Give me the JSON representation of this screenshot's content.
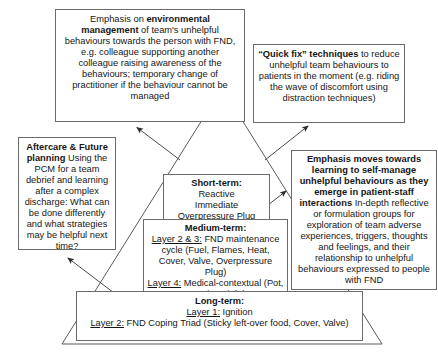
{
  "diagram": {
    "colors": {
      "box_border": "#6b6b6b",
      "triangle_stroke": "#5a5a5a",
      "arrow_stroke": "#4a4a4a",
      "background": "#ffffff",
      "text": "#161616"
    },
    "boxes": {
      "environmental_management": {
        "name": "environmental-management-box",
        "lead_bold": "environmental management",
        "lead_prefix": "Emphasis on ",
        "body": " of team's unhelpful behaviours towards the person with FND, e.g. colleague supporting another colleague raising awareness of the behaviours; temporary change of practitioner if the behaviour cannot be managed"
      },
      "quick_fix": {
        "name": "quick-fix-box",
        "lead_bold": "“Quick fix” techniques",
        "body": " to reduce unhelpful team behaviours to patients in the moment (e.g. riding the wave of discomfort using distraction techniques)"
      },
      "aftercare": {
        "name": "aftercare-future-planning-box",
        "heading": "Aftercare & Future planning",
        "body": "Using the PCM for a team debrief and learning after a complex discharge: What can be done differently and what strategies may be helpful next time?"
      },
      "self_manage": {
        "name": "self-manage-box",
        "heading": "Emphasis moves towards learning to self-manage unhelpful behaviours as they emerge in patient-staff interactions",
        "body": "In-depth reflective or formulation groups for exploration of team adverse experiences, triggers, thoughts and feelings, and their relationship to unhelpful behaviours expressed to people with FND"
      },
      "short_term": {
        "name": "short-term-box",
        "heading": "Short-term:",
        "line1": "Reactive",
        "line2": "Immediate",
        "line3": "Overpressure Plug"
      },
      "medium_term": {
        "name": "medium-term-box",
        "heading": "Medium-term:",
        "layer_23_label": "Layer 2 & 3:",
        "layer_23_text": " FND maintenance cycle (Fuel, Flames, Heat, Cover, Valve, Overpressure Plug)",
        "layer_4_label": "Layer 4:",
        "layer_4_text": " Medical-contextual (Pot, Warning Light)"
      },
      "long_term": {
        "name": "long-term-box",
        "heading": "Long-term:",
        "layer_1_label": "Layer 1:",
        "layer_1_text": " Ignition",
        "layer_2_label": "Layer 2:",
        "layer_2_text": " FND Coping Triad (Sticky left-over food, Cover, Valve)"
      }
    },
    "shapes": {
      "triangle": {
        "name": "timeframe-triangle",
        "apex": [
          222,
          88
        ],
        "base_left": [
          62,
          344
        ],
        "base_right": [
          382,
          344
        ]
      },
      "arrows": [
        {
          "name": "arrow-to-environmental-management",
          "from": [
            180,
            160
          ],
          "to": [
            135,
            126
          ]
        },
        {
          "name": "arrow-to-quick-fix",
          "from": [
            265,
            160
          ],
          "to": [
            310,
            127
          ]
        },
        {
          "name": "arrow-to-self-manage",
          "from": [
            240,
            226
          ],
          "to": [
            288,
            190
          ]
        },
        {
          "name": "arrow-to-aftercare",
          "from": [
            118,
            296
          ],
          "to": [
            66,
            257
          ]
        }
      ]
    }
  }
}
